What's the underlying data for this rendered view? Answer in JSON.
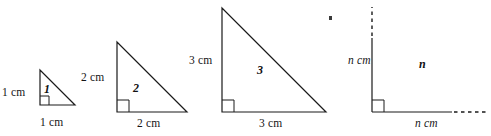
{
  "figure": {
    "unit_label": "cm",
    "stroke_color": "#1a1a1a",
    "background_color": "#ffffff",
    "artifact_mark": "·",
    "shapes": [
      {
        "id": "triangle-1",
        "index_label": "1",
        "vertical_label": "1 cm",
        "horizontal_label": "1 cm",
        "leg_length_cm": 1,
        "closed": true
      },
      {
        "id": "triangle-2",
        "index_label": "2",
        "vertical_label": "2 cm",
        "horizontal_label": "2 cm",
        "leg_length_cm": 2,
        "closed": true
      },
      {
        "id": "triangle-3",
        "index_label": "3",
        "vertical_label": "3 cm",
        "horizontal_label": "3 cm",
        "leg_length_cm": 3,
        "closed": true
      },
      {
        "id": "triangle-n",
        "index_label": "n",
        "vertical_label": "n cm",
        "horizontal_label": "n cm",
        "leg_length_cm": "n",
        "closed": false
      }
    ]
  }
}
